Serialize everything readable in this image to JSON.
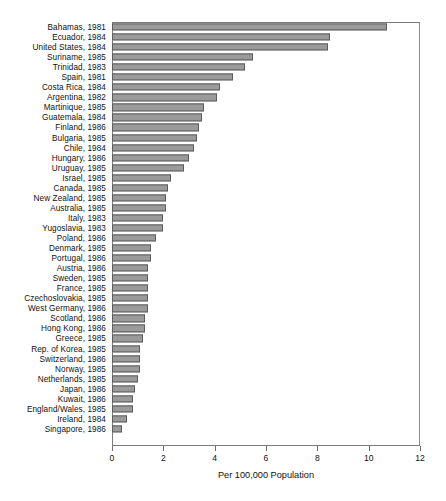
{
  "chart_data": {
    "type": "bar",
    "orientation": "horizontal",
    "title": "",
    "xlabel": "Per 100,000 Population",
    "ylabel": "",
    "xlim": [
      0,
      12
    ],
    "xticks": [
      0,
      2,
      4,
      6,
      8,
      10,
      12
    ],
    "xtick_labels": [
      "0",
      "2",
      "4",
      "6",
      "8",
      "10",
      "12"
    ],
    "grid": false,
    "legend": null,
    "bar_color": "#9a9a9a",
    "bar_edge_color": "#5c5c5c",
    "categories": [
      "Bahamas, 1981",
      "Ecuador, 1984",
      "United States, 1984",
      "Suriname, 1985",
      "Trinidad, 1983",
      "Spain, 1981",
      "Costa Rica, 1984",
      "Argentina, 1982",
      "Martinique, 1985",
      "Guatemala, 1984",
      "Finland, 1986",
      "Bulgaria, 1985",
      "Chile, 1984",
      "Hungary, 1986",
      "Uruguay, 1985",
      "Israel, 1985",
      "Canada, 1985",
      "New Zealand, 1985",
      "Australia, 1985",
      "Italy, 1983",
      "Yugoslavia, 1983",
      "Poland, 1986",
      "Denmark, 1985",
      "Portugal, 1986",
      "Austria, 1986",
      "Sweden, 1985",
      "France, 1985",
      "Czechoslovakia, 1985",
      "West Germany, 1986",
      "Scotland, 1986",
      "Hong Kong, 1986",
      "Greece, 1985",
      "Rep. of Korea, 1985",
      "Switzerland, 1986",
      "Norway, 1985",
      "Netherlands, 1985",
      "Japan, 1986",
      "Kuwait, 1986",
      "England/Wales, 1985",
      "Ireland, 1984",
      "Singapore, 1986"
    ],
    "values": [
      10.7,
      8.5,
      8.4,
      5.5,
      5.2,
      4.7,
      4.2,
      4.1,
      3.6,
      3.5,
      3.4,
      3.3,
      3.2,
      3.0,
      2.8,
      2.3,
      2.2,
      2.1,
      2.1,
      2.0,
      2.0,
      1.7,
      1.5,
      1.5,
      1.4,
      1.4,
      1.4,
      1.4,
      1.4,
      1.3,
      1.3,
      1.2,
      1.1,
      1.1,
      1.1,
      1.0,
      0.9,
      0.8,
      0.8,
      0.6,
      0.4
    ]
  }
}
